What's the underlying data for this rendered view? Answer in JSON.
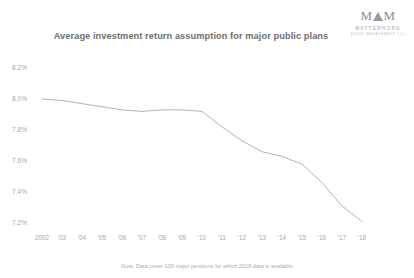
{
  "header": {
    "title": "Average investment return assumption for major public plans"
  },
  "brand": {
    "mark_left": "M",
    "mark_right": "M",
    "name": "MATTERHORN",
    "tagline": "ASSET MANAGEMENT LLC",
    "logo_icon": "mountain-peak-icon",
    "color": "#8d8d90"
  },
  "footnote": {
    "text": "Note: Data cover 109 major pensions for which 2018 data is available"
  },
  "chart_data": {
    "type": "line",
    "title": "Average investment return assumption for major public plans",
    "xlabel": "",
    "ylabel": "",
    "categories": [
      "2002",
      "'03",
      "'04",
      "'05",
      "'06",
      "'07",
      "'08",
      "'09",
      "'10",
      "'11",
      "'12",
      "'13",
      "'14",
      "'15",
      "'16",
      "'17",
      "'18"
    ],
    "x": [
      2002,
      2003,
      2004,
      2005,
      2006,
      2007,
      2008,
      2009,
      2010,
      2011,
      2012,
      2013,
      2014,
      2015,
      2016,
      2017,
      2018
    ],
    "values": [
      8.0,
      7.99,
      7.97,
      7.95,
      7.93,
      7.92,
      7.93,
      7.93,
      7.92,
      7.82,
      7.73,
      7.66,
      7.63,
      7.58,
      7.46,
      7.31,
      7.21
    ],
    "series": [
      {
        "name": "Average assumed return",
        "values": [
          8.0,
          7.99,
          7.97,
          7.95,
          7.93,
          7.92,
          7.93,
          7.93,
          7.92,
          7.82,
          7.73,
          7.66,
          7.63,
          7.58,
          7.46,
          7.31,
          7.21
        ]
      }
    ],
    "ylim": [
      7.2,
      8.2
    ],
    "yticks": [
      8.2,
      8.0,
      7.8,
      7.6,
      7.4,
      7.2
    ],
    "ytick_labels": [
      "8.2%",
      "8.0%",
      "7.8%",
      "7.6%",
      "7.4%",
      "7.2%"
    ],
    "grid": false,
    "legend": "none",
    "line_color": "#b4b4b7",
    "line_width": 1
  }
}
